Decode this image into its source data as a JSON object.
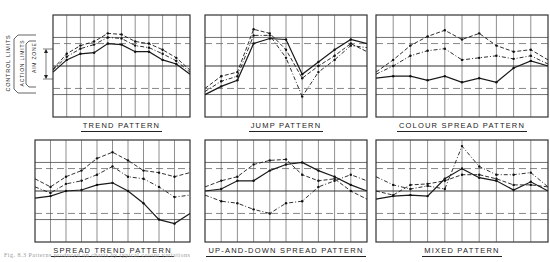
{
  "figure": {
    "caption": "Fig. 8.3  Patterns produced on charts by typical colour variations",
    "legend_labels": {
      "control_limits": "CONTROL LIMITS",
      "action_limits": "ACTION LIMITS",
      "aim_zone": "AIM ZONE"
    },
    "line_styles": [
      "solid",
      "dashed",
      "dash-dot"
    ],
    "colors": {
      "ink": "#1a1a1a",
      "grid": "#333333",
      "background": "#ffffff"
    }
  },
  "chart_data": [
    {
      "type": "line",
      "title": "TREND PATTERN",
      "x": [
        0,
        1,
        2,
        3,
        4,
        5,
        6,
        7,
        8,
        9,
        10
      ],
      "reference_lines": {
        "upper_control": 78,
        "upper_action": 72,
        "center": 50,
        "lower_action": 28,
        "lower_control": 22
      },
      "ylim": [
        0,
        100
      ],
      "grid": true,
      "series": [
        {
          "name": "solid",
          "style": "solid",
          "values": [
            44,
            56,
            62,
            63,
            72,
            71,
            64,
            64,
            56,
            52,
            42
          ]
        },
        {
          "name": "dashed",
          "style": "dashed",
          "values": [
            47,
            62,
            70,
            74,
            82,
            81,
            74,
            72,
            66,
            58,
            46
          ]
        },
        {
          "name": "dash-dot",
          "style": "dashdot",
          "values": [
            46,
            59,
            67,
            71,
            78,
            77,
            70,
            68,
            62,
            55,
            44
          ]
        }
      ]
    },
    {
      "type": "line",
      "title": "JUMP PATTERN",
      "x": [
        0,
        1,
        2,
        3,
        4,
        5,
        6,
        7,
        8,
        9,
        10
      ],
      "reference_lines": {
        "upper_control": 78,
        "upper_action": 72,
        "center": 50,
        "lower_action": 28,
        "lower_control": 22
      },
      "ylim": [
        0,
        100
      ],
      "grid": true,
      "series": [
        {
          "name": "solid",
          "style": "solid",
          "values": [
            22,
            30,
            36,
            72,
            77,
            76,
            42,
            54,
            66,
            76,
            72
          ]
        },
        {
          "name": "dashed",
          "style": "dashed",
          "values": [
            28,
            40,
            44,
            86,
            82,
            66,
            38,
            50,
            60,
            72,
            64
          ]
        },
        {
          "name": "dash-dot",
          "style": "dashdot",
          "values": [
            25,
            35,
            40,
            80,
            80,
            58,
            20,
            44,
            56,
            70,
            68
          ]
        }
      ]
    },
    {
      "type": "line",
      "title": "COLOUR SPREAD PATTERN",
      "x": [
        0,
        1,
        2,
        3,
        4,
        5,
        6,
        7,
        8,
        9,
        10
      ],
      "reference_lines": {
        "upper_control": 78,
        "upper_action": 72,
        "center": 50,
        "lower_action": 28,
        "lower_control": 22
      },
      "ylim": [
        0,
        100
      ],
      "grid": true,
      "series": [
        {
          "name": "solid",
          "style": "solid",
          "values": [
            38,
            40,
            40,
            36,
            40,
            34,
            38,
            34,
            48,
            55,
            50
          ]
        },
        {
          "name": "dashed",
          "style": "dashed",
          "values": [
            44,
            56,
            70,
            79,
            85,
            76,
            82,
            70,
            64,
            66,
            56
          ]
        },
        {
          "name": "dash-dot",
          "style": "dashdot",
          "values": [
            42,
            50,
            60,
            65,
            67,
            56,
            58,
            60,
            57,
            60,
            52
          ]
        }
      ]
    },
    {
      "type": "line",
      "title": "SPREAD TREND PATTERN",
      "x": [
        0,
        1,
        2,
        3,
        4,
        5,
        6,
        7,
        8,
        9,
        10
      ],
      "reference_lines": {
        "upper_control": 78,
        "upper_action": 72,
        "center": 50,
        "lower_action": 28,
        "lower_control": 22
      },
      "ylim": [
        0,
        100
      ],
      "grid": true,
      "series": [
        {
          "name": "solid",
          "style": "solid",
          "values": [
            43,
            45,
            50,
            51,
            56,
            58,
            50,
            38,
            22,
            18,
            28
          ]
        },
        {
          "name": "dashed",
          "style": "dashed",
          "values": [
            62,
            54,
            64,
            70,
            82,
            88,
            80,
            70,
            68,
            64,
            68
          ]
        },
        {
          "name": "dash-dot",
          "style": "dashdot",
          "values": [
            54,
            48,
            57,
            60,
            66,
            74,
            64,
            62,
            54,
            44,
            46
          ]
        }
      ]
    },
    {
      "type": "line",
      "title": "UP-AND-DOWN SPREAD PATTERN",
      "x": [
        0,
        1,
        2,
        3,
        4,
        5,
        6,
        7,
        8,
        9,
        10
      ],
      "reference_lines": {
        "upper_control": 78,
        "upper_action": 72,
        "center": 50,
        "lower_action": 28,
        "lower_control": 22
      },
      "ylim": [
        0,
        100
      ],
      "grid": true,
      "series": [
        {
          "name": "solid",
          "style": "solid",
          "values": [
            50,
            52,
            60,
            60,
            70,
            76,
            78,
            70,
            64,
            56,
            50
          ]
        },
        {
          "name": "dashed",
          "style": "dashed",
          "values": [
            54,
            60,
            64,
            76,
            80,
            81,
            66,
            60,
            62,
            50,
            42
          ]
        },
        {
          "name": "dash-dot",
          "style": "dashdot",
          "values": [
            46,
            40,
            38,
            32,
            28,
            38,
            40,
            54,
            60,
            66,
            60
          ]
        }
      ]
    },
    {
      "type": "line",
      "title": "MIXED PATTERN",
      "x": [
        0,
        1,
        2,
        3,
        4,
        5,
        6,
        7,
        8,
        9,
        10
      ],
      "reference_lines": {
        "upper_control": 78,
        "upper_action": 72,
        "center": 50,
        "lower_action": 28,
        "lower_control": 22
      },
      "ylim": [
        0,
        100
      ],
      "grid": true,
      "series": [
        {
          "name": "solid",
          "style": "solid",
          "values": [
            42,
            45,
            46,
            45,
            62,
            72,
            63,
            60,
            51,
            59,
            50
          ]
        },
        {
          "name": "dashed",
          "style": "dashed",
          "values": [
            50,
            46,
            56,
            57,
            60,
            66,
            66,
            62,
            56,
            56,
            54
          ]
        },
        {
          "name": "dash-dot",
          "style": "dashdot",
          "values": [
            64,
            56,
            52,
            55,
            52,
            94,
            74,
            66,
            66,
            68,
            54
          ]
        }
      ]
    }
  ]
}
